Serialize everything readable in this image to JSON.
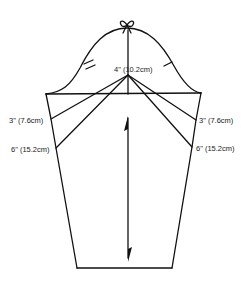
{
  "diagram": {
    "type": "sleeve-pattern",
    "stroke_color": "#111111",
    "background": "#ffffff",
    "labels": {
      "cap_height": "4\" (10.2cm)",
      "left_upper": "3\" (7.6cm)",
      "left_lower": "6\" (15.2cm)",
      "right_upper": "3\" (7.6cm)",
      "right_lower": "6\" (15.2cm)"
    },
    "marks": {
      "top": "shoulder-bow-notch",
      "back_notch": "double-notch",
      "front_notch": "single-notch",
      "grainline": "double-arrow"
    }
  }
}
